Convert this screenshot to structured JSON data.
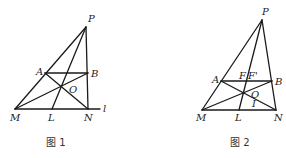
{
  "figures": [
    {
      "caption": "图 1",
      "points": {
        "P": {
          "label": "P"
        },
        "A": {
          "label": "A"
        },
        "B": {
          "label": "B"
        },
        "O": {
          "label": "O"
        },
        "M": {
          "label": "M"
        },
        "L": {
          "label": "L"
        },
        "N": {
          "label": "N"
        },
        "l": {
          "label": "l"
        }
      }
    },
    {
      "caption": "图 2",
      "points": {
        "P": {
          "label": "P"
        },
        "A": {
          "label": "A"
        },
        "B": {
          "label": "B"
        },
        "F": {
          "label": "F"
        },
        "F2": {
          "label": "F'"
        },
        "O": {
          "label": "O"
        },
        "M": {
          "label": "M"
        },
        "L": {
          "label": "L"
        },
        "N": {
          "label": "N"
        },
        "I": {
          "label": "I"
        }
      }
    }
  ]
}
